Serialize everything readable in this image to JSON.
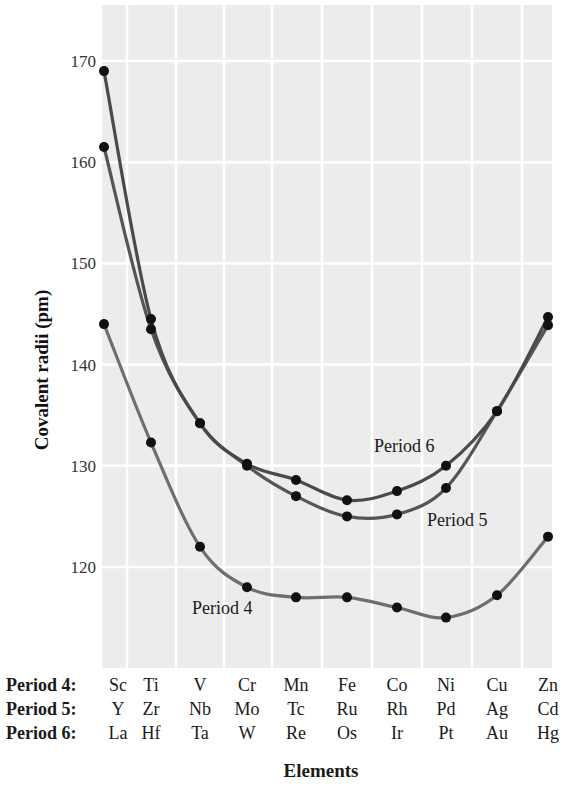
{
  "chart_data": {
    "type": "line",
    "title": "",
    "xlabel": "Elements",
    "ylabel": "Covalent radii (pm)",
    "ylim": [
      112,
      175
    ],
    "yticks": [
      120,
      130,
      140,
      150,
      160,
      170
    ],
    "grid": true,
    "legend_position": "inline labels",
    "x_positions": [
      1,
      2,
      3,
      4,
      5,
      6,
      7,
      8,
      9,
      10
    ],
    "series": [
      {
        "name": "Period 4",
        "row_header": "Period 4:",
        "elements": [
          "Sc",
          "Ti",
          "V",
          "Cr",
          "Mn",
          "Fe",
          "Co",
          "Ni",
          "Cu",
          "Zn"
        ],
        "values": [
          144,
          132.3,
          122,
          118,
          117,
          117,
          116,
          115,
          117.2,
          123
        ]
      },
      {
        "name": "Period 5",
        "row_header": "Period 5:",
        "elements": [
          "Y",
          "Zr",
          "Nb",
          "Mo",
          "Tc",
          "Ru",
          "Rh",
          "Pd",
          "Ag",
          "Cd"
        ],
        "values": [
          161.5,
          143.5,
          134.2,
          130,
          127,
          125,
          125.2,
          127.8,
          135.4,
          143.9
        ]
      },
      {
        "name": "Period 6",
        "row_header": "Period 6:",
        "elements": [
          "La",
          "Hf",
          "Ta",
          "W",
          "Re",
          "Os",
          "Ir",
          "Pt",
          "Au",
          "Hg"
        ],
        "values": [
          169,
          144.5,
          134.2,
          130.2,
          128.6,
          126.6,
          127.5,
          130,
          135.4,
          144.7
        ]
      }
    ],
    "annotations": [
      {
        "text": "Period 6",
        "series": "Period 6"
      },
      {
        "text": "Period 5",
        "series": "Period 5"
      },
      {
        "text": "Period 4",
        "series": "Period 4"
      }
    ]
  },
  "colors": {
    "plot_background": "#ececec",
    "grid": "#ffffff",
    "line_period4": "#6e6e6e",
    "line_period5": "#555555",
    "line_period6": "#4a4a4a",
    "marker": "#111111"
  }
}
